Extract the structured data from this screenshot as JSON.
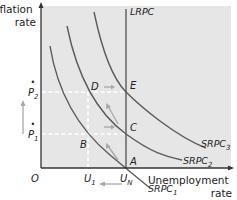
{
  "diagram": {
    "type": "phillips-curve",
    "y_axis_label_line1": "Inflation",
    "y_axis_label_line2": "rate",
    "x_axis_label_line1": "Unemployment",
    "x_axis_label_line2": "rate",
    "origin_label": "O",
    "lrpc_label": "LRPC",
    "curves": [
      {
        "name": "SRPC",
        "sub": "1"
      },
      {
        "name": "SRPC",
        "sub": "2"
      },
      {
        "name": "SRPC",
        "sub": "3"
      }
    ],
    "y_ticks": [
      {
        "label": "P",
        "sub": "2",
        "dot": "•"
      },
      {
        "label": "P",
        "sub": "1",
        "dot": "•"
      }
    ],
    "x_ticks": [
      {
        "label": "U",
        "sub": "1"
      },
      {
        "label": "U",
        "sub": "N"
      }
    ],
    "points": {
      "A": "A",
      "B": "B",
      "C": "C",
      "D": "D",
      "E": "E"
    },
    "colors": {
      "plot_bg": "#e6e6e6",
      "curve": "#5a5a5a",
      "axis": "#333333",
      "dashed": "#ffffff",
      "arrow": "#a8a8a8"
    }
  }
}
